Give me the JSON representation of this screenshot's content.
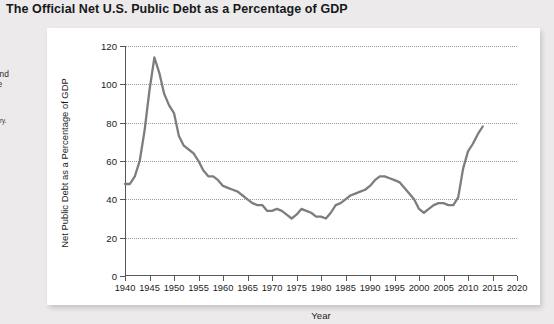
{
  "figure": {
    "title": "The Official Net U.S. Public Debt as a Percentage of GDP"
  },
  "caption": {
    "body": "e offi-\nlic debt\ner the\n70s,\n980s, and\nre in the\ns\ny.",
    "lines": [
      "e offi-",
      "lic debt",
      "er the",
      "70s,",
      "980s, and",
      "re in the",
      "s",
      "y."
    ],
    "source": "he Treasury."
  },
  "chart_data": {
    "type": "line",
    "title": "The Official Net U.S. Public Debt as a Percentage of GDP",
    "xlabel": "Year",
    "ylabel": "Net Public Debt as a Percentage of GDP",
    "xlim": [
      1940,
      2020
    ],
    "ylim": [
      0,
      120
    ],
    "xticks": [
      1940,
      1945,
      1950,
      1955,
      1960,
      1965,
      1970,
      1975,
      1980,
      1985,
      1990,
      1995,
      2000,
      2005,
      2010,
      2015,
      2020
    ],
    "yticks": [
      0,
      20,
      40,
      60,
      80,
      100,
      120
    ],
    "grid": "horizontal-dotted",
    "legend": "none",
    "line_color": "#7d7d7d",
    "series": [
      {
        "name": "Net public debt as a percentage of GDP",
        "x": [
          1940,
          1941,
          1942,
          1943,
          1944,
          1945,
          1946,
          1947,
          1948,
          1949,
          1950,
          1951,
          1952,
          1953,
          1954,
          1955,
          1956,
          1957,
          1958,
          1959,
          1960,
          1961,
          1962,
          1963,
          1964,
          1965,
          1966,
          1967,
          1968,
          1969,
          1970,
          1971,
          1972,
          1973,
          1974,
          1975,
          1976,
          1977,
          1978,
          1979,
          1980,
          1981,
          1982,
          1983,
          1984,
          1985,
          1986,
          1987,
          1988,
          1989,
          1990,
          1991,
          1992,
          1993,
          1994,
          1995,
          1996,
          1997,
          1998,
          1999,
          2000,
          2001,
          2002,
          2003,
          2004,
          2005,
          2006,
          2007,
          2008,
          2009,
          2010,
          2011,
          2012,
          2013
        ],
        "y": [
          48,
          48,
          52,
          60,
          76,
          97,
          114,
          106,
          95,
          89,
          85,
          73,
          68,
          66,
          64,
          60,
          55,
          52,
          52,
          50,
          47,
          46,
          45,
          44,
          42,
          40,
          38,
          37,
          37,
          34,
          34,
          35,
          34,
          32,
          30,
          32,
          35,
          34,
          33,
          31,
          31,
          30,
          33,
          37,
          38,
          40,
          42,
          43,
          44,
          45,
          47,
          50,
          52,
          52,
          51,
          50,
          49,
          46,
          43,
          40,
          35,
          33,
          35,
          37,
          38,
          38,
          37,
          37,
          41,
          56,
          65,
          69,
          74,
          78
        ]
      }
    ],
    "annotations": {
      "wwii_peak_year": 1946,
      "wwii_peak_value": 114,
      "recent_value_year": 2013,
      "recent_value": 78
    }
  }
}
